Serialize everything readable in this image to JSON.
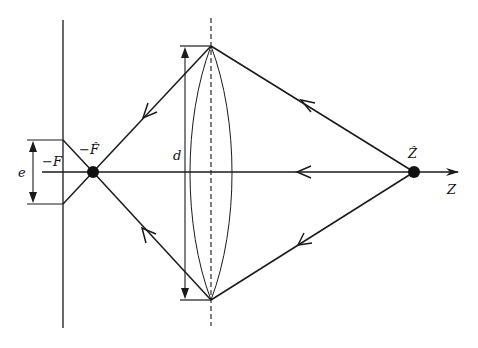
{
  "diagram": {
    "type": "optics-ray-diagram",
    "colors": {
      "stroke": "#1a1a1a",
      "background": "#ffffff"
    },
    "labels": {
      "minus_F": "−F",
      "minus_F_hat": "−F̂",
      "Z_hat": "Ẑ",
      "Z_axis": "Z",
      "d": "d",
      "e": "e"
    },
    "elements": {
      "lens": "biconvex lens with dashed principal plane",
      "source_point": "Ẑ",
      "focus_point": "−F̂",
      "screen": "vertical plane at −F",
      "rays": [
        "top marginal ray",
        "axial ray",
        "bottom marginal ray"
      ]
    }
  }
}
